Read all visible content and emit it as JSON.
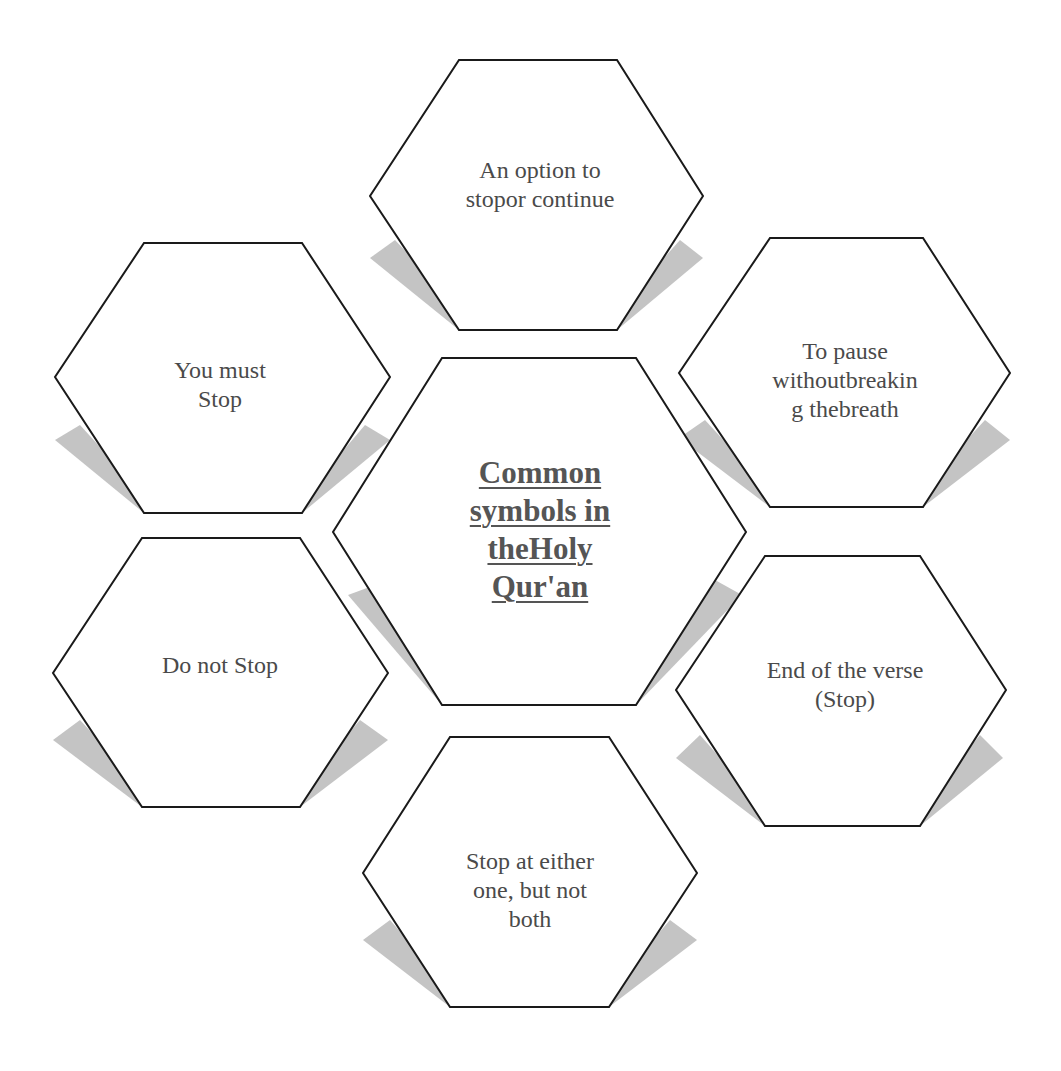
{
  "diagram": {
    "type": "hexagon-cluster",
    "center": {
      "label": "Common symbols in theHoly Qur'an",
      "lines": [
        "Common",
        "symbols in",
        "theHoly",
        "Qur'an"
      ]
    },
    "nodes": [
      {
        "position": "top",
        "lines": [
          "An option to",
          "stopor continue"
        ]
      },
      {
        "position": "top-right",
        "lines": [
          "To pause",
          "withoutbreakin",
          "g thebreath"
        ]
      },
      {
        "position": "bottom-right",
        "lines": [
          "End of the verse",
          "(Stop)"
        ]
      },
      {
        "position": "bottom",
        "lines": [
          "Stop at either",
          "one, but not",
          "both"
        ]
      },
      {
        "position": "bottom-left",
        "lines": [
          "Do not Stop"
        ]
      },
      {
        "position": "top-left",
        "lines": [
          "You must",
          "Stop"
        ]
      }
    ]
  },
  "colors": {
    "stroke": "#1a1a1a",
    "fill": "#ffffff",
    "shadow": "#bdbdbd",
    "text": "#4a4a4a"
  }
}
